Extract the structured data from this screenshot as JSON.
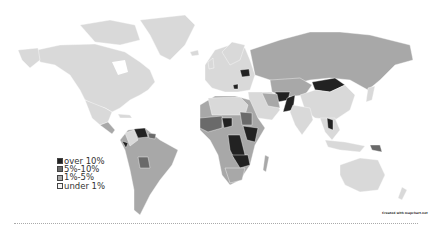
{
  "map": {
    "type": "world choropleth",
    "colors": {
      "over_10": "#222222",
      "5_10": "#6a6a6a",
      "1_5": "#a8a8a8",
      "under_1": "#d9d9d9",
      "border": "#ffffff"
    }
  },
  "legend": {
    "items": [
      {
        "label": "over 10%",
        "color": "#222222"
      },
      {
        "label": "5%-10%",
        "color": "#6a6a6a"
      },
      {
        "label": "1%-5%",
        "color": "#a8a8a8"
      },
      {
        "label": "under 1%",
        "color": "#f4f4f4"
      }
    ]
  },
  "watermark": "Created with mapchart.net"
}
